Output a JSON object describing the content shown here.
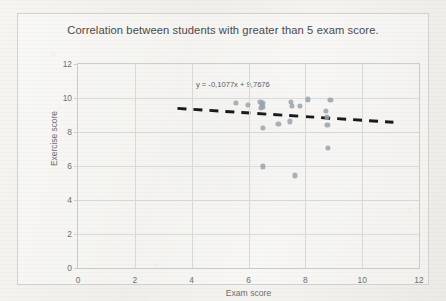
{
  "chart_data": {
    "type": "scatter",
    "title": "Correlation between students with greater than 5 exam score.",
    "xlabel": "Exam score",
    "ylabel": "Exercise score",
    "xlim": [
      0,
      12
    ],
    "ylim": [
      0,
      12
    ],
    "xticks": [
      0,
      2,
      4,
      6,
      8,
      10,
      12
    ],
    "yticks": [
      0,
      2,
      4,
      6,
      8,
      10,
      12
    ],
    "grid": true,
    "legend": "none",
    "marker_color": "#9aa3ad",
    "trendline_color": "#1a1a1a",
    "annotations": [
      {
        "text": "y = -0,1077x + 9,7676",
        "x": 5.45,
        "y": 10.85,
        "kind": "trendline-equation"
      }
    ],
    "trendline": {
      "style": "dashed",
      "slope": -0.1077,
      "intercept": 9.7676,
      "x_start": 3.5,
      "x_end": 11.1
    },
    "series": [
      {
        "name": "Students",
        "points": [
          [
            5.55,
            9.72
          ],
          [
            5.98,
            9.57
          ],
          [
            6.42,
            9.78
          ],
          [
            6.48,
            9.62
          ],
          [
            6.5,
            9.5
          ],
          [
            6.52,
            9.7
          ],
          [
            6.45,
            9.4
          ],
          [
            6.5,
            8.22
          ],
          [
            6.52,
            5.98
          ],
          [
            7.05,
            8.48
          ],
          [
            7.48,
            9.78
          ],
          [
            7.52,
            9.52
          ],
          [
            7.45,
            8.62
          ],
          [
            7.62,
            5.45
          ],
          [
            7.82,
            9.55
          ],
          [
            8.08,
            9.92
          ],
          [
            8.72,
            9.25
          ],
          [
            8.75,
            8.88
          ],
          [
            8.78,
            8.4
          ],
          [
            8.88,
            9.9
          ],
          [
            8.8,
            7.05
          ]
        ]
      }
    ]
  }
}
